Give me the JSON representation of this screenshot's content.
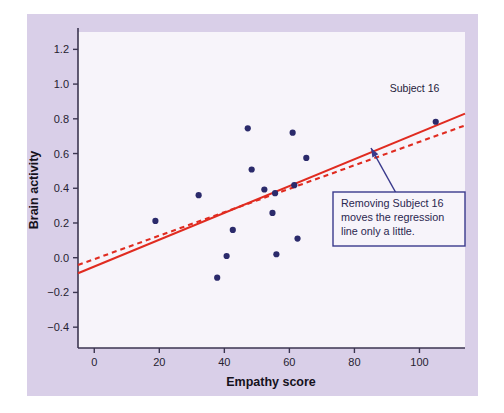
{
  "figure": {
    "panel_background": "#d9cfe8",
    "plot_background": "#f7f4fa",
    "axis_color": "#3b3550",
    "point_color": "#2b2a6b",
    "regression_color": "#e02b20",
    "callout_border_color": "#3a3a8c",
    "arrow_color": "#3a3a8c"
  },
  "chart_data": {
    "type": "scatter",
    "title": "",
    "xlabel": "Empathy score",
    "ylabel": "Brain activity",
    "xlim": [
      -5,
      114
    ],
    "ylim": [
      -0.52,
      1.3
    ],
    "xticks": [
      0,
      20,
      40,
      60,
      80,
      100
    ],
    "xtick_labels": [
      "0",
      "20",
      "40",
      "60",
      "80",
      "100"
    ],
    "yticks": [
      1.2,
      1.0,
      0.8,
      0.6,
      0.4,
      0.2,
      0.0,
      -0.2,
      -0.4
    ],
    "ytick_labels": [
      "1.2",
      "1.0",
      "0.8",
      "0.6",
      "0.4",
      "0.2",
      "0.0",
      "−0.2",
      "−0.4"
    ],
    "grid": false,
    "legend": false,
    "points": [
      {
        "x": 18.8,
        "y": 0.212
      },
      {
        "x": 32.1,
        "y": 0.36
      },
      {
        "x": 37.8,
        "y": -0.115
      },
      {
        "x": 40.7,
        "y": 0.01
      },
      {
        "x": 42.6,
        "y": 0.16
      },
      {
        "x": 47.2,
        "y": 0.745
      },
      {
        "x": 48.4,
        "y": 0.508
      },
      {
        "x": 52.3,
        "y": 0.393
      },
      {
        "x": 54.8,
        "y": 0.258
      },
      {
        "x": 55.6,
        "y": 0.372
      },
      {
        "x": 56.0,
        "y": 0.02
      },
      {
        "x": 61.0,
        "y": 0.72
      },
      {
        "x": 61.5,
        "y": 0.418
      },
      {
        "x": 62.5,
        "y": 0.11
      },
      {
        "x": 65.2,
        "y": 0.575
      },
      {
        "x": 105.0,
        "y": 0.783
      }
    ],
    "lines": [
      {
        "name": "regression-all-subjects",
        "style": "solid",
        "color": "#e02b20",
        "x0": -5,
        "y0": -0.09,
        "x1": 114,
        "y1": 0.83
      },
      {
        "name": "regression-without-subject-16",
        "style": "dashed",
        "color": "#e02b20",
        "x0": -5,
        "y0": -0.042,
        "x1": 114,
        "y1": 0.762
      }
    ],
    "annotations": [
      {
        "name": "subject-16-label",
        "text": "Subject 16",
        "x": 98.5,
        "y": 0.955
      }
    ]
  },
  "callout": {
    "line1": "Removing Subject 16",
    "line2": "moves the regression",
    "line3": "line only a little.",
    "arrow_from_x": 396,
    "arrow_from_y": 193,
    "arrow_to_x": 371,
    "arrow_to_y": 148
  }
}
